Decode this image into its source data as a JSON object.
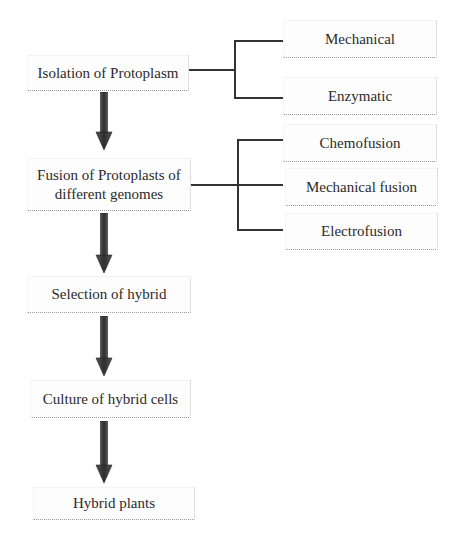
{
  "diagram": {
    "main_flow": [
      {
        "id": "isolation",
        "label": "Isolation of Protoplasm"
      },
      {
        "id": "fusion",
        "label": "Fusion of Protoplasts of\ndifferent genomes"
      },
      {
        "id": "selection",
        "label": "Selection of hybrid"
      },
      {
        "id": "culture",
        "label": "Culture of hybrid cells"
      },
      {
        "id": "hybrid_plants",
        "label": "Hybrid plants"
      }
    ],
    "isolation_methods": [
      {
        "id": "mechanical",
        "label": "Mechanical"
      },
      {
        "id": "enzymatic",
        "label": "Enzymatic"
      }
    ],
    "fusion_methods": [
      {
        "id": "chemofusion",
        "label": "Chemofusion"
      },
      {
        "id": "mechanical_fusion",
        "label": "Mechanical fusion"
      },
      {
        "id": "electrofusion",
        "label": "Electrofusion"
      }
    ],
    "colors": {
      "arrow": "#3a3a3a",
      "line": "#333333",
      "text": "#2b2b2b"
    }
  }
}
